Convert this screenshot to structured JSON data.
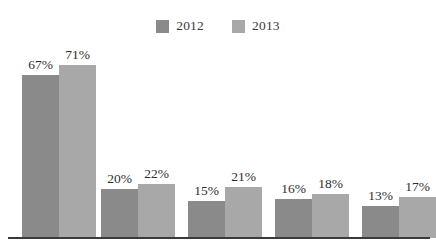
{
  "legend": {
    "position": "top-center",
    "entries": [
      {
        "label": "2012",
        "color": "#8a8a8a"
      },
      {
        "label": "2013",
        "color": "#a8a8a8"
      }
    ]
  },
  "axis": {
    "baseline_visible": true,
    "baseline_color": "#3a3a3a",
    "y_axis_visible": false,
    "gridlines": false,
    "category_labels_visible": false
  },
  "chart_data": {
    "type": "bar",
    "title": "",
    "xlabel": "",
    "ylabel": "",
    "ylim": [
      0,
      80
    ],
    "grid": false,
    "legend_position": "top-center",
    "value_suffix": "%",
    "categories": [
      "",
      "",
      "",
      "",
      ""
    ],
    "series": [
      {
        "name": "2012",
        "color": "#8a8a8a",
        "values": [
          67,
          20,
          15,
          16,
          13
        ],
        "labels": [
          "67%",
          "20%",
          "15%",
          "16%",
          "13%"
        ]
      },
      {
        "name": "2013",
        "color": "#a8a8a8",
        "values": [
          71,
          22,
          21,
          18,
          17
        ],
        "labels": [
          "71%",
          "22%",
          "21%",
          "18%",
          "17%"
        ]
      }
    ]
  },
  "geometry": {
    "baseline_y": 238,
    "bar_width": 37,
    "group_starts": [
      22,
      101,
      188,
      275,
      362
    ],
    "pixels_per_unit": 2.44
  }
}
